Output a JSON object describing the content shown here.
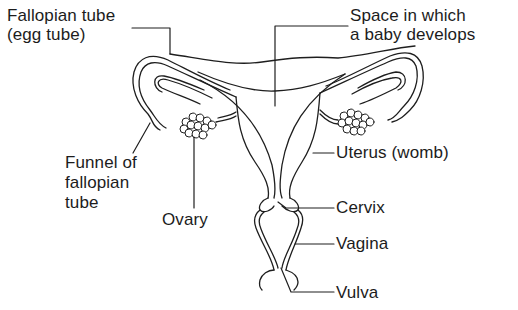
{
  "diagram": {
    "labels": {
      "fallopian_tube": [
        "Fallopian tube",
        "(egg tube)"
      ],
      "space_baby": [
        "Space in which",
        "a baby develops"
      ],
      "funnel": [
        "Funnel of",
        "fallopian",
        "tube"
      ],
      "ovary": [
        "Ovary"
      ],
      "uterus": [
        "Uterus (womb)"
      ],
      "cervix": [
        "Cervix"
      ],
      "vagina": [
        "Vagina"
      ],
      "vulva": [
        "Vulva"
      ]
    }
  }
}
